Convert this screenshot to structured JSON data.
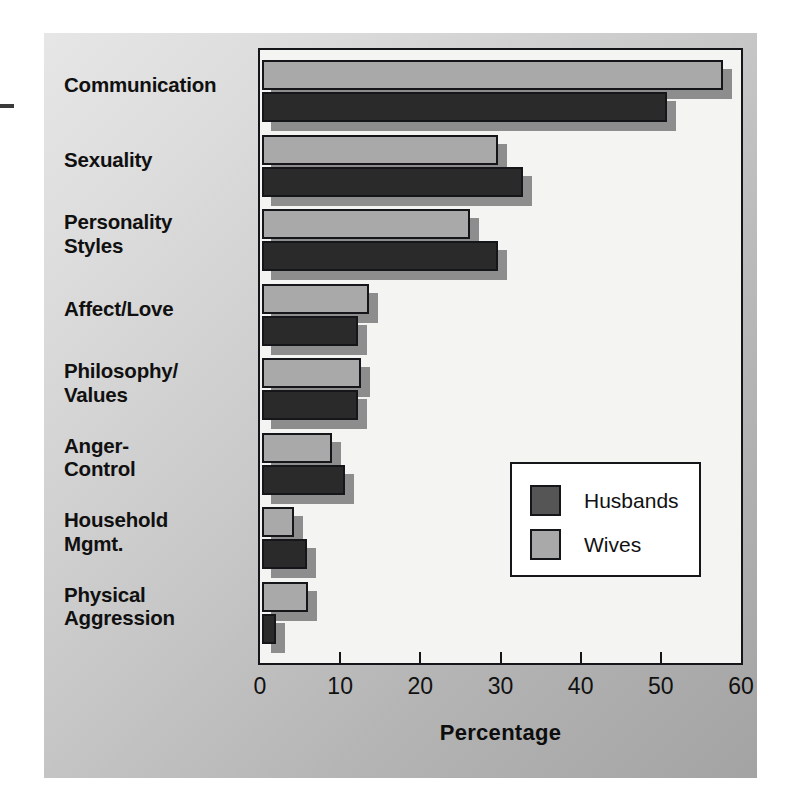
{
  "figure": {
    "axis_title": "Percentage",
    "legend": {
      "items": [
        {
          "label": "Husbands",
          "color": "#555555"
        },
        {
          "label": "Wives",
          "color": "#a9a9a9"
        }
      ]
    },
    "colors": {
      "husbands": "#2a2a2a",
      "wives": "#a9a9a9",
      "shadow": "#8d8d8d",
      "plot_background": "#f4f4f2",
      "panel_background": "#c9c9c9",
      "outline": "#15161a"
    }
  },
  "chart_data": {
    "type": "bar",
    "orientation": "horizontal",
    "title": "",
    "xlabel": "Percentage",
    "ylabel": "",
    "xlim": [
      0,
      60
    ],
    "xticks": [
      0,
      10,
      20,
      30,
      40,
      50,
      60
    ],
    "xtick_labels": [
      "0",
      "10",
      "20",
      "30",
      "40",
      "50",
      "60"
    ],
    "grid": false,
    "legend_position": "center-right inside plot",
    "categories": [
      "Communication",
      "Sexuality",
      "Personality Styles",
      "Affect/Love",
      "Philosophy/Values",
      "Anger-Control",
      "Household Mgmt.",
      "Physical Aggression"
    ],
    "category_labels_multiline": [
      "Communication",
      "Sexuality",
      "Personality\nStyles",
      "Affect/Love",
      "Philosophy/\nValues",
      "Anger-\nControl",
      "Household\nMgmt.",
      "Physical\nAggression"
    ],
    "series": [
      {
        "name": "Wives",
        "color": "#a9a9a9",
        "values": [
          57.5,
          29.5,
          26.0,
          13.3,
          12.3,
          8.7,
          4.0,
          5.8
        ]
      },
      {
        "name": "Husbands",
        "color": "#2a2a2a",
        "values": [
          50.5,
          32.5,
          29.5,
          12.0,
          12.0,
          10.4,
          5.6,
          1.7
        ]
      }
    ]
  }
}
